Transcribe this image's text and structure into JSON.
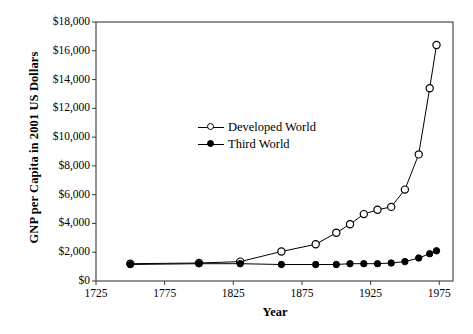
{
  "chart_data": {
    "type": "line",
    "title": "",
    "xlabel": "Year",
    "ylabel": "GNP per Capita in 2001 US Dollars",
    "xlim": [
      1725,
      1985
    ],
    "ylim": [
      0,
      18000
    ],
    "xticks": [
      "1725",
      "1775",
      "1825",
      "1875",
      "1925",
      "1975"
    ],
    "xtick_values": [
      1725,
      1775,
      1825,
      1875,
      1925,
      1975
    ],
    "yticks": [
      "$0",
      "$2,000",
      "$4,000",
      "$6,000",
      "$8,000",
      "$10,000",
      "$12,000",
      "$14,000",
      "$16,000",
      "$18,000"
    ],
    "ytick_values": [
      0,
      2000,
      4000,
      6000,
      8000,
      10000,
      12000,
      14000,
      16000,
      18000
    ],
    "grid": false,
    "legend_position": "inside-upper-middle",
    "series": [
      {
        "name": "Developed World",
        "marker": "open-circle",
        "color": "#000000",
        "points": [
          {
            "x": 1750,
            "y": 1200
          },
          {
            "x": 1800,
            "y": 1250
          },
          {
            "x": 1830,
            "y": 1350
          },
          {
            "x": 1860,
            "y": 2050
          },
          {
            "x": 1885,
            "y": 2550
          },
          {
            "x": 1900,
            "y": 3350
          },
          {
            "x": 1910,
            "y": 3950
          },
          {
            "x": 1920,
            "y": 4650
          },
          {
            "x": 1930,
            "y": 4950
          },
          {
            "x": 1940,
            "y": 5150
          },
          {
            "x": 1950,
            "y": 6350
          },
          {
            "x": 1960,
            "y": 8800
          },
          {
            "x": 1968,
            "y": 13400
          },
          {
            "x": 1973,
            "y": 16400
          }
        ]
      },
      {
        "name": "Third World",
        "marker": "filled-circle",
        "color": "#000000",
        "points": [
          {
            "x": 1750,
            "y": 1150
          },
          {
            "x": 1800,
            "y": 1200
          },
          {
            "x": 1830,
            "y": 1200
          },
          {
            "x": 1860,
            "y": 1150
          },
          {
            "x": 1885,
            "y": 1150
          },
          {
            "x": 1900,
            "y": 1150
          },
          {
            "x": 1910,
            "y": 1200
          },
          {
            "x": 1920,
            "y": 1200
          },
          {
            "x": 1930,
            "y": 1200
          },
          {
            "x": 1940,
            "y": 1250
          },
          {
            "x": 1950,
            "y": 1350
          },
          {
            "x": 1960,
            "y": 1600
          },
          {
            "x": 1968,
            "y": 1900
          },
          {
            "x": 1973,
            "y": 2100
          }
        ]
      }
    ]
  }
}
